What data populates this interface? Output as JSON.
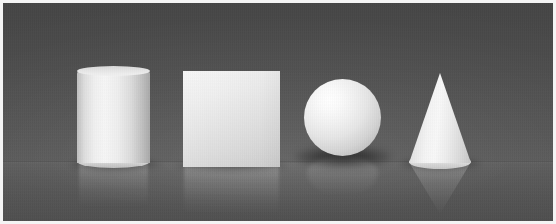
{
  "scene": {
    "title": "Rendered 3D primitives on reflective floor",
    "width": 556,
    "height": 224,
    "render_style": "ray-traced CLEVR-style scene",
    "lighting": "key light from upper-left, soft fill",
    "background": {
      "wall_color": "#4c4c4c",
      "floor_color": "#565656",
      "horizon_y": 159,
      "reflective_floor": true,
      "frame_color": "#f4f4f4"
    },
    "objects": [
      {
        "id": "cylinder",
        "label": "Cylinder",
        "shape": "cylinder",
        "material": "matte",
        "color_name": "gray",
        "color_hex": "#ededed",
        "x": 74,
        "y": 63,
        "width": 73,
        "height": 102,
        "has_reflection": true,
        "has_shadow": true
      },
      {
        "id": "cube",
        "label": "Cube",
        "shape": "cube",
        "material": "matte",
        "color_name": "gray",
        "color_hex": "#e8e8e8",
        "x": 180,
        "y": 68,
        "width": 97,
        "height": 96,
        "has_reflection": true,
        "has_shadow": true
      },
      {
        "id": "sphere",
        "label": "Sphere",
        "shape": "sphere",
        "material": "matte",
        "color_name": "white",
        "color_hex": "#f2f2f2",
        "x": 301,
        "y": 76,
        "width": 77,
        "height": 77,
        "has_reflection": true,
        "has_shadow": true
      },
      {
        "id": "cone",
        "label": "Cone",
        "shape": "cone",
        "material": "matte",
        "color_name": "gray",
        "color_hex": "#efefef",
        "x": 406,
        "y": 70,
        "width": 62,
        "height": 96,
        "has_reflection": true,
        "has_shadow": true
      }
    ]
  }
}
